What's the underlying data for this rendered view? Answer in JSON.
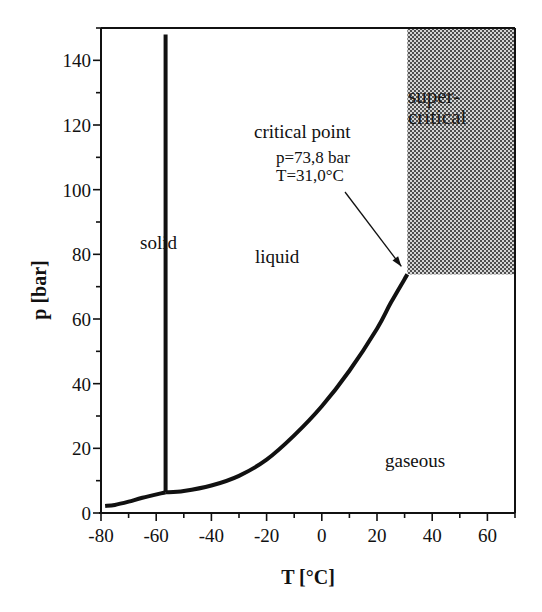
{
  "chart_data": {
    "type": "line",
    "title": "",
    "xlabel": "T [°C]",
    "ylabel": "p [bar]",
    "xlim": [
      -80,
      70
    ],
    "ylim": [
      0,
      150
    ],
    "xticks": [
      -80,
      -60,
      -40,
      -20,
      0,
      20,
      40,
      60
    ],
    "xtick_labels": [
      "-80",
      "-60",
      "-40",
      "-20",
      "0",
      "20",
      "40",
      "60"
    ],
    "yticks": [
      0,
      20,
      40,
      60,
      80,
      100,
      120,
      140
    ],
    "ytick_labels": [
      "0",
      "20",
      "40",
      "60",
      "80",
      "100",
      "120",
      "140"
    ],
    "grid": false,
    "legend": null,
    "series": [
      {
        "name": "sublimation curve",
        "x": [
          -78.5,
          -75,
          -70,
          -65,
          -56.6
        ],
        "y": [
          2.2,
          2.5,
          3.5,
          4.7,
          6.4
        ]
      },
      {
        "name": "melting curve",
        "x": [
          -56.6,
          -56.6
        ],
        "y": [
          6.4,
          148
        ]
      },
      {
        "name": "vaporization curve",
        "x": [
          -56.6,
          -50,
          -40,
          -30,
          -20,
          -10,
          0,
          10,
          20,
          25,
          31.0
        ],
        "y": [
          6.4,
          6.8,
          8.5,
          11.5,
          16.5,
          24,
          33,
          44,
          57,
          65,
          73.8
        ]
      }
    ],
    "regions": [
      {
        "name": "solid",
        "label": "solid"
      },
      {
        "name": "liquid",
        "label": "liquid"
      },
      {
        "name": "gaseous",
        "label": "gaseous"
      },
      {
        "name": "supercritical",
        "label_line1": "super-",
        "label_line2": "critical",
        "x_range": [
          31.0,
          70
        ],
        "y_range": [
          73.8,
          150
        ],
        "fill": "hatched gray"
      }
    ],
    "annotations": [
      {
        "text": "critical point",
        "line2": "p=73,8 bar",
        "line3": "T=31,0°C",
        "points_to": {
          "x": 31.0,
          "y": 73.8
        }
      }
    ]
  },
  "labels": {
    "solid": "solid",
    "liquid": "liquid",
    "gaseous": "gaseous",
    "super1": "super-",
    "super2": "critical",
    "cp1": "critical point",
    "cp2": "p=73,8 bar",
    "cp3": "T=31,0°C",
    "xlabel": "T [°C]",
    "ylabel": "p [bar]"
  },
  "colors": {
    "line": "#111111",
    "hatch_dark": "#5a5a5a",
    "hatch_light": "#d8d8d8"
  }
}
